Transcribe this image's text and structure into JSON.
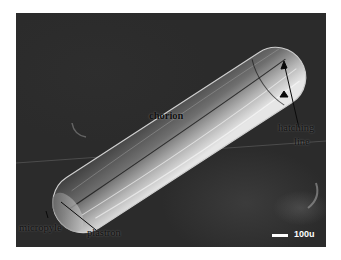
{
  "figure": {
    "type": "scanning electron micrograph",
    "labels": {
      "chorion": "chorion",
      "hatching_line_1": "hatching",
      "hatching_line_2": "line",
      "micropyle": "micropyle",
      "plastron": "plastron"
    },
    "scale_bar": {
      "text": "100u"
    },
    "colors": {
      "background": "#2b2b2b",
      "egg_highlight": "#d8d8d8",
      "label_text": "#111111",
      "scale_text": "#ffffff"
    }
  }
}
